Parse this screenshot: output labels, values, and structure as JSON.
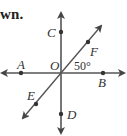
{
  "caption": "wn.",
  "diagram": {
    "type": "intersecting-lines",
    "center_label": "O",
    "angle_label": "50°",
    "points": [
      {
        "name": "A",
        "label": "A"
      },
      {
        "name": "B",
        "label": "B"
      },
      {
        "name": "C",
        "label": "C"
      },
      {
        "name": "D",
        "label": "D"
      },
      {
        "name": "E",
        "label": "E"
      },
      {
        "name": "F",
        "label": "F"
      }
    ],
    "lines": [
      {
        "name": "line-AB",
        "through": [
          "A",
          "O",
          "B"
        ],
        "orientation": "horizontal"
      },
      {
        "name": "line-CD",
        "through": [
          "C",
          "O",
          "D"
        ],
        "orientation": "vertical"
      },
      {
        "name": "line-EF",
        "through": [
          "E",
          "O",
          "F"
        ],
        "orientation": "diagonal"
      }
    ],
    "colors": {
      "line": "#555555",
      "text": "#333333"
    }
  }
}
